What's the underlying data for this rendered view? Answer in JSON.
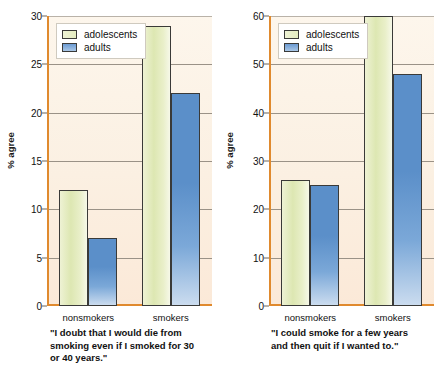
{
  "chart_data": [
    {
      "type": "bar",
      "panel": "left",
      "title": "",
      "categories": [
        "nonsmokers",
        "smokers"
      ],
      "series": [
        {
          "name": "adolescents",
          "values": [
            12,
            29
          ],
          "color": "#e4ecc0"
        },
        {
          "name": "adults",
          "values": [
            7,
            22
          ],
          "color": "#5b8fc9"
        }
      ],
      "xlabel": "",
      "ylabel": "% agree",
      "ylim": [
        0,
        30
      ],
      "yticks": [
        0,
        5,
        10,
        15,
        20,
        25,
        30
      ],
      "ytick_labels": [
        "0",
        "5",
        "10",
        "15",
        "20",
        "25",
        "30"
      ],
      "grid": true,
      "legend_position": "top-left",
      "caption_lines": [
        "\"I doubt that I would die from",
        "smoking even if I smoked for 30",
        "or 40 years.\""
      ]
    },
    {
      "type": "bar",
      "panel": "right",
      "title": "",
      "categories": [
        "nonsmokers",
        "smokers"
      ],
      "series": [
        {
          "name": "adolescents",
          "values": [
            26,
            60
          ],
          "color": "#e4ecc0"
        },
        {
          "name": "adults",
          "values": [
            25,
            48
          ],
          "color": "#5b8fc9"
        }
      ],
      "xlabel": "",
      "ylabel": "% agree",
      "ylim": [
        0,
        60
      ],
      "yticks": [
        0,
        10,
        20,
        30,
        40,
        50,
        60
      ],
      "ytick_labels": [
        "0",
        "10",
        "20",
        "30",
        "40",
        "50",
        "60"
      ],
      "grid": true,
      "legend_position": "top-left",
      "caption_lines": [
        "\"I could smoke for a few years",
        "and then quit if I wanted to.\""
      ]
    }
  ],
  "left_panel": {
    "ylabel": "% agree",
    "legend": {
      "items": [
        {
          "label": "adolescents"
        },
        {
          "label": "adults"
        }
      ]
    },
    "yticks": [
      "30",
      "25",
      "20",
      "15",
      "10",
      "5",
      "0"
    ],
    "xticks": [
      "nonsmokers",
      "smokers"
    ],
    "caption": {
      "line1": "\"I doubt that I would die from",
      "line2": "smoking even if I smoked for 30",
      "line3": "or 40 years.\""
    }
  },
  "right_panel": {
    "ylabel": "% agree",
    "legend": {
      "items": [
        {
          "label": "adolescents"
        },
        {
          "label": "adults"
        }
      ]
    },
    "yticks": [
      "60",
      "50",
      "40",
      "30",
      "20",
      "10",
      "0"
    ],
    "xticks": [
      "nonsmokers",
      "smokers"
    ],
    "caption": {
      "line1": "\"I could smoke for a few years",
      "line2": "and then quit if I wanted to.\"",
      "line3": ""
    }
  },
  "colors": {
    "adolescents_bar": "#e4ecc0",
    "adults_bar": "#5b8fc9",
    "plot_background": "#fbf0e2",
    "axis": "#e08a2e",
    "gridline": "#9a9287",
    "bar_outline": "#3a3a38"
  }
}
